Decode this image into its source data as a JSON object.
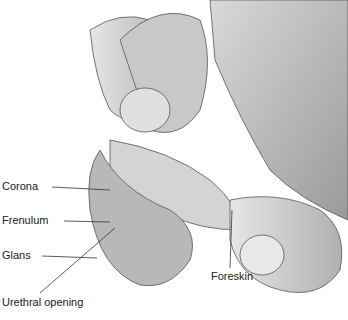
{
  "diagram": {
    "type": "anatomical-illustration",
    "labels": [
      {
        "id": "corona",
        "text": "Corona"
      },
      {
        "id": "frenulum",
        "text": "Frenulum"
      },
      {
        "id": "glans",
        "text": "Glans"
      },
      {
        "id": "urethral_opening",
        "text": "Urethral opening"
      },
      {
        "id": "foreskin",
        "text": "Foreskin"
      }
    ]
  }
}
